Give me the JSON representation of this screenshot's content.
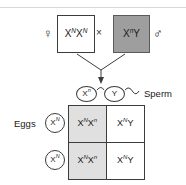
{
  "diagram": {
    "type": "punnett-square",
    "colors": {
      "line": "#3c3c3c",
      "male_box_fill": "#9e9e9e",
      "shaded_cell_fill": "#e0e0e0",
      "background": "#ffffff",
      "top_rule": "#d6d8da"
    }
  },
  "parents": {
    "female": {
      "symbol": "♀",
      "symbol_name": "female-symbol",
      "allele1": "X",
      "sup1": "N",
      "allele2": "X",
      "sup2": "N",
      "shaded": false
    },
    "male": {
      "symbol": "♂",
      "symbol_name": "male-symbol",
      "allele1": "X",
      "sup1": "n",
      "allele2": "Y",
      "sup2": "",
      "shaded": true
    },
    "cross_symbol": "×"
  },
  "gametes": {
    "sperm_label": "Sperm",
    "eggs_label": "Eggs",
    "sperm": [
      {
        "allele": "X",
        "sup": "n"
      },
      {
        "allele": "Y",
        "sup": ""
      }
    ],
    "eggs": [
      {
        "allele": "X",
        "sup": "N"
      },
      {
        "allele": "X",
        "sup": "N"
      }
    ]
  },
  "punnett": {
    "column_headers": [
      "X^n",
      "Y"
    ],
    "row_headers": [
      "X^N",
      "X^N"
    ],
    "cells": [
      {
        "a1": "X",
        "s1": "N",
        "a2": "X",
        "s2": "n",
        "shaded": true,
        "text": "X^N X^n"
      },
      {
        "a1": "X",
        "s1": "N",
        "a2": "Y",
        "s2": "",
        "shaded": false,
        "text": "X^N Y"
      },
      {
        "a1": "X",
        "s1": "N",
        "a2": "X",
        "s2": "n",
        "shaded": true,
        "text": "X^N X^n"
      },
      {
        "a1": "X",
        "s1": "N",
        "a2": "Y",
        "s2": "",
        "shaded": false,
        "text": "X^N Y"
      }
    ]
  }
}
